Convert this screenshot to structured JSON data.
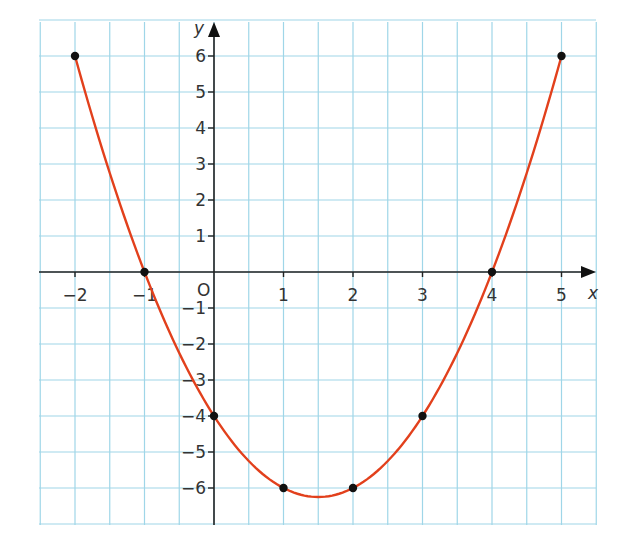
{
  "chart_data": {
    "type": "line",
    "title": "",
    "xlabel": "x",
    "ylabel": "y",
    "origin_label": "O",
    "xlim": [
      -2.5,
      5.5
    ],
    "ylim": [
      -7,
      7
    ],
    "grid": true,
    "x_ticks": [
      -2,
      -1,
      1,
      2,
      3,
      4,
      5
    ],
    "x_tick_labels": [
      "−2",
      "−1",
      "1",
      "2",
      "3",
      "4",
      "5"
    ],
    "y_ticks": [
      6,
      5,
      4,
      3,
      2,
      1,
      -1,
      -2,
      -3,
      -4,
      -5,
      -6
    ],
    "y_tick_labels": [
      "6",
      "5",
      "4",
      "3",
      "2",
      "1",
      "−1",
      "−2",
      "−3",
      "−4",
      "−5",
      "−6"
    ],
    "series": [
      {
        "name": "y = x² − 3x − 4",
        "color": "#e2401c",
        "x_range": [
          -2,
          5
        ],
        "points": [
          {
            "x": -2,
            "y": 6
          },
          {
            "x": -1,
            "y": 0
          },
          {
            "x": 0,
            "y": -4
          },
          {
            "x": 1,
            "y": -6
          },
          {
            "x": 2,
            "y": -6
          },
          {
            "x": 3,
            "y": -4
          },
          {
            "x": 4,
            "y": 0
          },
          {
            "x": 5,
            "y": 6
          }
        ],
        "vertex": {
          "x": 1.5,
          "y": -6.25
        }
      }
    ],
    "colors": {
      "grid": "#9fd6e8",
      "axis": "#222222",
      "curve": "#e2401c",
      "points": "#111111"
    }
  }
}
